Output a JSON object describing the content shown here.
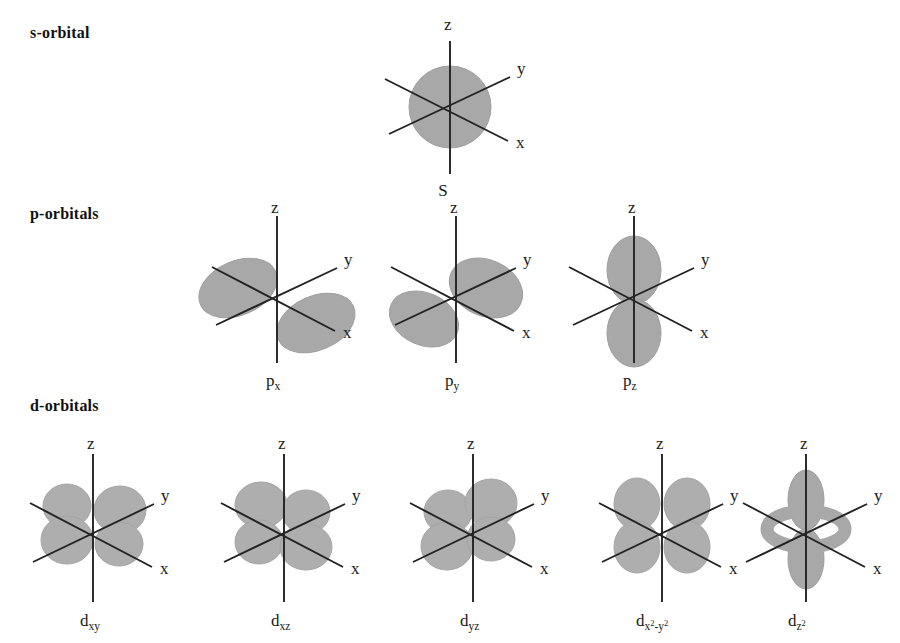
{
  "figure": {
    "background_color": "#ffffff",
    "lobe_color": "#a8a8a8",
    "lobe_stroke_color": "#9a9a9a",
    "axis_color": "#222222",
    "text_color": "#1a1a1a"
  },
  "rows": [
    {
      "id": "s",
      "label": "s-orbital"
    },
    {
      "id": "p",
      "label": "p-orbitals"
    },
    {
      "id": "d",
      "label": "d-orbitals"
    }
  ],
  "axes": {
    "z": "z",
    "y": "y",
    "x": "x"
  },
  "orbitals": [
    {
      "id": "s",
      "row": "s",
      "name": "S",
      "name_base": "S",
      "name_sub": "",
      "shape": "sphere",
      "axis_labels": {
        "z": "z",
        "y": "y",
        "x": "x"
      }
    },
    {
      "id": "px",
      "row": "p",
      "name": "px",
      "name_base": "p",
      "name_sub": "x",
      "shape": "dumbbell-x",
      "axis_labels": {
        "z": "z",
        "y": "y",
        "x": "x"
      }
    },
    {
      "id": "py",
      "row": "p",
      "name": "py",
      "name_base": "p",
      "name_sub": "y",
      "shape": "dumbbell-y",
      "axis_labels": {
        "z": "z",
        "y": "y",
        "x": "x"
      }
    },
    {
      "id": "pz",
      "row": "p",
      "name": "pz",
      "name_base": "p",
      "name_sub": "z",
      "shape": "dumbbell-z",
      "axis_labels": {
        "z": "z",
        "y": "y",
        "x": "x"
      }
    },
    {
      "id": "dxy",
      "row": "d",
      "name": "dxy",
      "name_base": "d",
      "name_sub": "xy",
      "shape": "cloverleaf-xy",
      "axis_labels": {
        "z": "z",
        "y": "y",
        "x": "x"
      }
    },
    {
      "id": "dxz",
      "row": "d",
      "name": "dxz",
      "name_base": "d",
      "name_sub": "xz",
      "shape": "cloverleaf-xz",
      "axis_labels": {
        "z": "z",
        "y": "y",
        "x": "x"
      }
    },
    {
      "id": "dyz",
      "row": "d",
      "name": "dyz",
      "name_base": "d",
      "name_sub": "yz",
      "shape": "cloverleaf-yz",
      "axis_labels": {
        "z": "z",
        "y": "y",
        "x": "x"
      }
    },
    {
      "id": "dx2y2",
      "row": "d",
      "name": "dx2-y2",
      "name_base": "d",
      "name_sub": "x",
      "name_sup1": "2",
      "name_mid": "-y",
      "name_sup2": "2",
      "shape": "cloverleaf-x2y2",
      "axis_labels": {
        "z": "z",
        "y": "y",
        "x": "x"
      }
    },
    {
      "id": "dz2",
      "row": "d",
      "name": "dz2",
      "name_base": "d",
      "name_sub": "z",
      "name_sup1": "2",
      "shape": "dumbbell-torus-z",
      "axis_labels": {
        "z": "z",
        "y": "y",
        "x": "x"
      }
    }
  ]
}
